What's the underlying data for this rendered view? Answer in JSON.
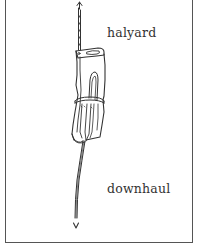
{
  "figure": {
    "labels": {
      "halyard": "halyard",
      "downhaul": "downhaul"
    },
    "elements": {
      "halyard_line": "rope leading up with arrow-up",
      "sail_bundle": "furled sail bundle",
      "lashing": "rope lashing around bundle",
      "downhaul_line": "rope leading down with arrow-down"
    },
    "colors": {
      "ink": "#333333",
      "frame": "#555555",
      "background": "#ffffff"
    }
  }
}
